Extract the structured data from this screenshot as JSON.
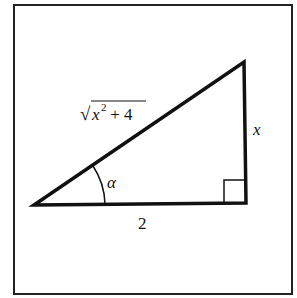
{
  "figure": {
    "type": "right-triangle",
    "hypotenuse_label": {
      "radical": "√",
      "base": "x",
      "exponent": "2",
      "rest": " + 4"
    },
    "opposite_label": "x",
    "adjacent_label": "2",
    "angle_label": "α",
    "right_angle_marker": true
  },
  "colors": {
    "stroke": "#111111",
    "background": "#ffffff"
  }
}
